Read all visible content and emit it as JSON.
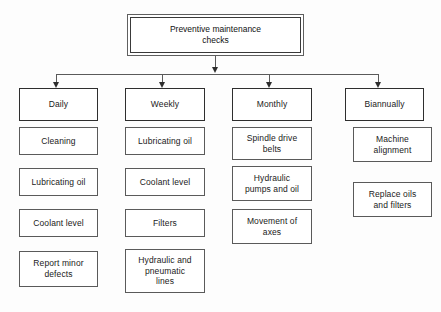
{
  "diagram": {
    "type": "org-tree",
    "root": {
      "label": "Preventive maintenance\nchecks"
    },
    "columns": [
      {
        "header": "Daily",
        "items": [
          "Cleaning",
          "Lubricating oil",
          "Coolant level",
          "Report minor\ndefects"
        ]
      },
      {
        "header": "Weekly",
        "items": [
          "Lubricating oil",
          "Coolant level",
          "Filters",
          "Hydraulic and\npneumatic\nlines"
        ]
      },
      {
        "header": "Monthly",
        "items": [
          "Spindle drive\nbelts",
          "Hydraulic\npumps and oil",
          "Movement of\naxes"
        ]
      },
      {
        "header": "Biannually",
        "items": [
          "Machine\nalignment",
          "Replace oils\nand filters"
        ]
      }
    ],
    "colors": {
      "background": "#fdfdfd",
      "box_fill": "#ffffff",
      "box_stroke": "#5a5a5a",
      "header_stroke": "#2e2e2e",
      "connector": "#5a5a5a",
      "text": "#1a1a1a"
    }
  }
}
